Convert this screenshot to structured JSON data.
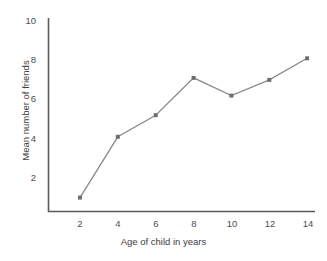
{
  "chart_data": {
    "type": "line",
    "title": "",
    "xlabel": "Age of child in years",
    "ylabel": "Mean number of friends",
    "x": [
      2,
      4,
      6,
      8,
      10,
      12,
      14
    ],
    "values": [
      1.0,
      4.1,
      5.2,
      7.1,
      6.2,
      7.0,
      8.1
    ],
    "xticks": [
      "2",
      "4",
      "6",
      "8",
      "10",
      "12",
      "14"
    ],
    "yticks": [
      "2",
      "4",
      "6",
      "8",
      "10"
    ],
    "xlim": [
      1,
      15
    ],
    "ylim": [
      0,
      10
    ],
    "grid": false,
    "legend": null,
    "marker": "square",
    "line_color": "#8a8a8a",
    "marker_color": "#6e6e6e",
    "axis_color": "#5a5a5a",
    "text_color": "#4d4d4d"
  }
}
